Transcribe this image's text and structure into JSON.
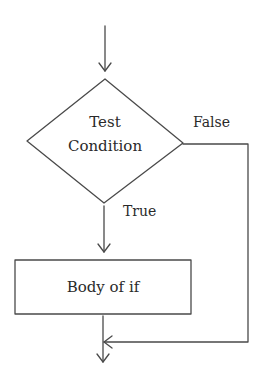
{
  "diagram": {
    "type": "flowchart",
    "title": "",
    "nodes": [
      {
        "id": "condition",
        "shape": "diamond",
        "label_line1": "Test",
        "label_line2": "Condition"
      },
      {
        "id": "body",
        "shape": "rectangle",
        "label": "Body of if"
      }
    ],
    "edges": [
      {
        "from": "entry",
        "to": "condition",
        "label": ""
      },
      {
        "from": "condition",
        "to": "body",
        "label": "True"
      },
      {
        "from": "condition",
        "to": "exit",
        "label": "False"
      },
      {
        "from": "body",
        "to": "exit",
        "label": ""
      }
    ],
    "labels": {
      "condition_line1": "Test",
      "condition_line2": "Condition",
      "false_branch": "False",
      "true_branch": "True",
      "body": "Body of if"
    },
    "colors": {
      "stroke": "#4a4a4a",
      "text": "#2a2a2a",
      "background": "#ffffff"
    }
  }
}
